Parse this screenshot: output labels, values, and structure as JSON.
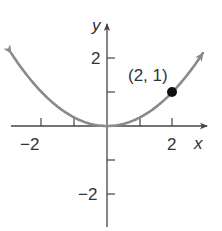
{
  "chart_data": {
    "type": "line",
    "title": "",
    "function": "y = x^2 / 4",
    "x": [
      -3,
      -2.5,
      -2,
      -1.5,
      -1,
      -0.5,
      0,
      0.5,
      1,
      1.5,
      2,
      2.5,
      3
    ],
    "series": [
      {
        "name": "y = x^2/4",
        "values": [
          2.25,
          1.5625,
          1,
          0.5625,
          0.25,
          0.0625,
          0,
          0.0625,
          0.25,
          0.5625,
          1,
          1.5625,
          2.25
        ],
        "color": "#8a8a8a"
      }
    ],
    "highlighted_point": {
      "x": 2,
      "y": 1,
      "label": "(2, 1)",
      "color": "#111111"
    },
    "xlabel": "x",
    "ylabel": "y",
    "xlim": [
      -3.2,
      3.4
    ],
    "ylim": [
      -3.1,
      2.9
    ],
    "x_ticks": [
      -2,
      -1,
      1,
      2
    ],
    "y_ticks": [
      -2,
      -1,
      1,
      2
    ],
    "x_tick_labels": [
      "-2",
      "2"
    ],
    "y_tick_labels": [
      "2",
      "-2"
    ],
    "grid": false,
    "legend": "none",
    "arrows_on_curve_ends": true
  },
  "labels": {
    "x_axis": "x",
    "y_axis": "y",
    "x_neg2": "−2",
    "x_pos2": "2",
    "y_pos2": "2",
    "y_neg2": "−2",
    "point": "(2, 1)"
  },
  "colors": {
    "axis": "#444444",
    "curve": "#8a8a8a",
    "point": "#111111",
    "text": "#333333"
  }
}
